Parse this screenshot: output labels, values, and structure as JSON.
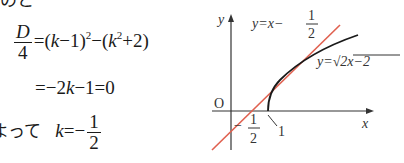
{
  "text_fragments": {
    "top_cut": "のと",
    "bottom_cut": "よって"
  },
  "equations": {
    "line1": {
      "lhs_num": "D",
      "lhs_den": "4",
      "rhs": "=(k−1)²−(k²+2)"
    },
    "line2": "=−2k−1=0",
    "line3": {
      "prefix": "よって",
      "lhs": "k=−",
      "num": "1",
      "den": "2"
    }
  },
  "graph": {
    "axis_x_label": "x",
    "axis_y_label": "y",
    "origin_label": "O",
    "line_label": "y=x−",
    "line_label_num": "1",
    "line_label_den": "2",
    "curve_label": "y=√2x−2",
    "x_intercept_label": "1",
    "y_intercept_label_sign": "−",
    "y_intercept_num": "1",
    "y_intercept_den": "2",
    "line_color": "#e0604f",
    "curve_color": "#1a1a1a"
  }
}
